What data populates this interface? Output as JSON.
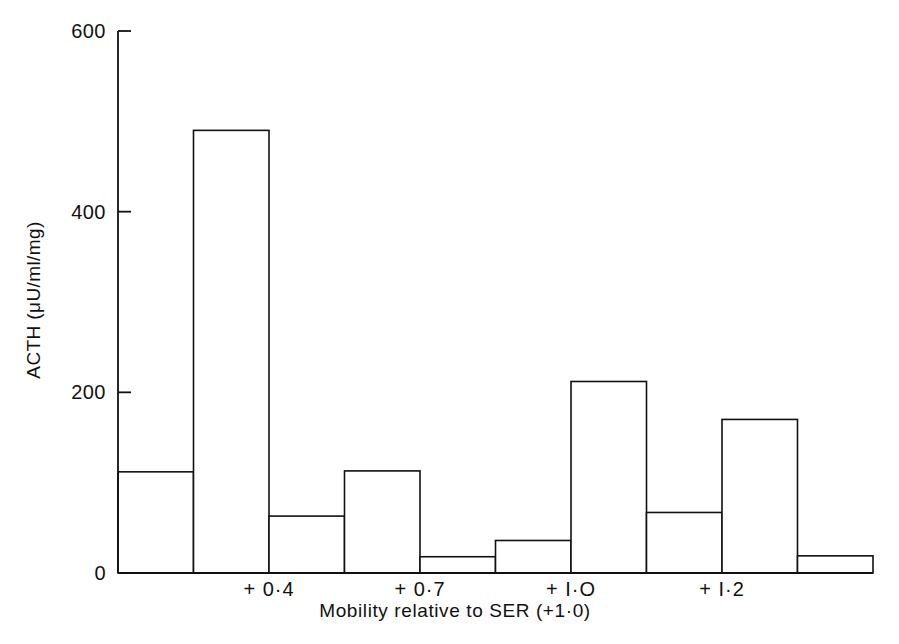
{
  "chart_data": {
    "type": "bar",
    "title": "",
    "subtitle": "",
    "xlabel": "Mobility relative to SER (+1·0)",
    "ylabel": "ACTH (μU/ml/mg)",
    "ylim": [
      0,
      600
    ],
    "yticks": [
      0,
      200,
      400,
      600
    ],
    "ytick_labels": [
      "0",
      "200",
      "400",
      "600"
    ],
    "xtick_labels": [
      "+ 0·4",
      "+ 0·7",
      "+ I·O",
      "+ I·2"
    ],
    "xtick_positions": [
      2,
      4,
      6,
      8
    ],
    "grid": false,
    "legend": null,
    "bar_style": {
      "fill": "#ffffff",
      "stroke": "#111111",
      "stroke_width": 1.6
    },
    "axis_color": "#111111",
    "background": "#ffffff",
    "categories": [
      "1",
      "2",
      "3",
      "4",
      "5",
      "6",
      "7",
      "8",
      "9",
      "10"
    ],
    "values": [
      112,
      490,
      63,
      113,
      18,
      36,
      212,
      67,
      170,
      19
    ],
    "note": "Contiguous histogram-style bars spanning the mobility axis"
  }
}
